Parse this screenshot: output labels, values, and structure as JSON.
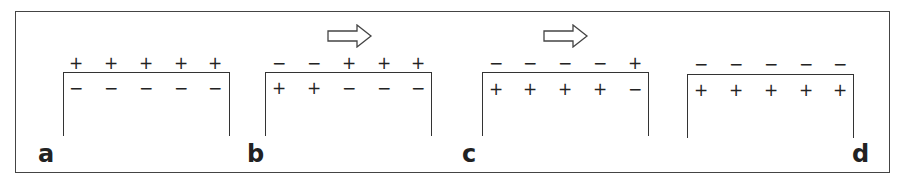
{
  "figure": {
    "panels": [
      {
        "label": "a",
        "outside": [
          "+",
          "+",
          "+",
          "+",
          "+"
        ],
        "inside": [
          "−",
          "−",
          "−",
          "−",
          "−"
        ],
        "arrow": false
      },
      {
        "label": "b",
        "outside": [
          "−",
          "−",
          "+",
          "+",
          "+"
        ],
        "inside": [
          "+",
          "+",
          "−",
          "−",
          "−"
        ],
        "arrow": true
      },
      {
        "label": "c",
        "outside": [
          "−",
          "−",
          "−",
          "−",
          "+"
        ],
        "inside": [
          "+",
          "+",
          "+",
          "+",
          "−"
        ],
        "arrow": true
      },
      {
        "label": "d",
        "outside": [
          "−",
          "−",
          "−",
          "−",
          "−"
        ],
        "inside": [
          "+",
          "+",
          "+",
          "+",
          "+"
        ],
        "arrow": false
      }
    ],
    "arrow_icon": "right-arrow-icon"
  }
}
